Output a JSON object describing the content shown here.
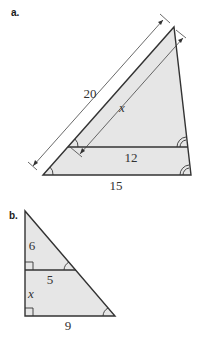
{
  "colors": {
    "fill": "#e6e6e6",
    "stroke": "#333333",
    "dim_line": "#444444"
  },
  "figure_a": {
    "label": "a.",
    "side_label": "20",
    "inner_side_label": "x",
    "middle_base_label": "12",
    "base_label": "15",
    "description": "Triangle with a segment parallel to the base; congruent angle markings at left and right vertices"
  },
  "figure_b": {
    "label": "b.",
    "upper_side_label": "6",
    "middle_base_label": "5",
    "lower_side_label": "x",
    "base_label": "9",
    "description": "Right triangle with a segment parallel to the base; right-angle markers at left side"
  }
}
